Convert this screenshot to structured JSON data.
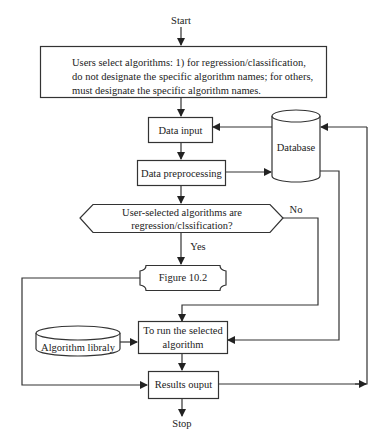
{
  "diagram": {
    "type": "flowchart",
    "nodes": {
      "start": {
        "label": "Start"
      },
      "select": {
        "lines": [
          "Users select algorithms: 1) for regression/classification,",
          "do not designate the specific algorithm names; for others,",
          "must designate the specific algorithm names."
        ]
      },
      "data_input": {
        "label": "Data input"
      },
      "database": {
        "label": "Database"
      },
      "preprocessing": {
        "label": "Data preprocessing"
      },
      "decision": {
        "lines": [
          "User-selected algorithms are",
          "regression/clssification?"
        ]
      },
      "figure": {
        "label": "Figure 10.2"
      },
      "run": {
        "lines": [
          "To run the selected",
          "algorithm"
        ]
      },
      "library": {
        "label": "Algorithm libraly"
      },
      "results": {
        "label": "Results ouput"
      },
      "stop": {
        "label": "Stop"
      }
    },
    "edges": {
      "yes": "Yes",
      "no": "No"
    },
    "colors": {
      "stroke": "#333333",
      "background": "#ffffff"
    }
  }
}
